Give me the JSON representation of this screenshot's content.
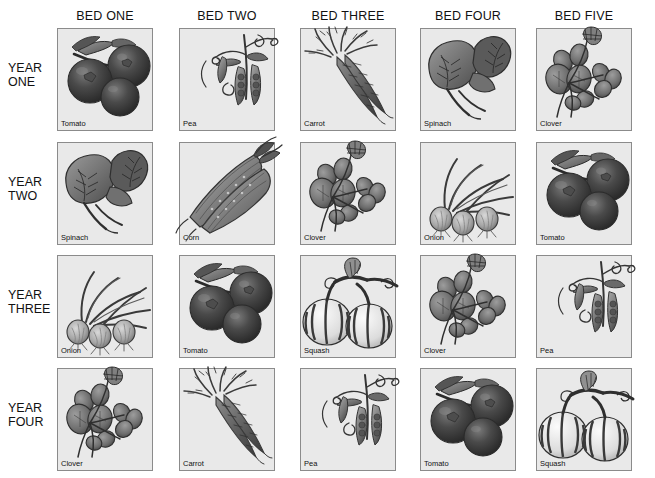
{
  "chart_data": {
    "type": "table",
    "xlabel": "",
    "ylabel": "",
    "columns": [
      "BED ONE",
      "BED TWO",
      "BED THREE",
      "BED FOUR",
      "BED FIVE"
    ],
    "rows": [
      "YEAR ONE",
      "YEAR TWO",
      "YEAR THREE",
      "YEAR FOUR"
    ],
    "cells": [
      [
        "Tomato",
        "Pea",
        "Carrot",
        "Spinach",
        "Clover"
      ],
      [
        "Spinach",
        "Corn",
        "Clover",
        "Onion",
        "Tomato"
      ],
      [
        "Onion",
        "Tomato",
        "Squash",
        "Clover",
        "Pea"
      ],
      [
        "Clover",
        "Carrot",
        "Pea",
        "Tomato",
        "Squash"
      ]
    ],
    "legend": [],
    "grid": false
  },
  "headers": [
    {
      "id": "bed-one",
      "label": "BED ONE"
    },
    {
      "id": "bed-two",
      "label": "BED TWO"
    },
    {
      "id": "bed-three",
      "label": "BED THREE"
    },
    {
      "id": "bed-four",
      "label": "BED FOUR"
    },
    {
      "id": "bed-five",
      "label": "BED FIVE"
    }
  ],
  "years": [
    {
      "id": "year-one",
      "line1": "YEAR",
      "line2": "ONE"
    },
    {
      "id": "year-two",
      "line1": "YEAR",
      "line2": "TWO"
    },
    {
      "id": "year-three",
      "line1": "YEAR",
      "line2": "THREE"
    },
    {
      "id": "year-four",
      "line1": "YEAR",
      "line2": "FOUR"
    }
  ],
  "panels": [
    {
      "row": 0,
      "col": 0,
      "crop": "Tomato",
      "art": "tomato"
    },
    {
      "row": 0,
      "col": 1,
      "crop": "Pea",
      "art": "pea"
    },
    {
      "row": 0,
      "col": 2,
      "crop": "Carrot",
      "art": "carrot"
    },
    {
      "row": 0,
      "col": 3,
      "crop": "Spinach",
      "art": "spinach"
    },
    {
      "row": 0,
      "col": 4,
      "crop": "Clover",
      "art": "clover"
    },
    {
      "row": 1,
      "col": 0,
      "crop": "Spinach",
      "art": "spinach"
    },
    {
      "row": 1,
      "col": 1,
      "crop": "Corn",
      "art": "corn"
    },
    {
      "row": 1,
      "col": 2,
      "crop": "Clover",
      "art": "clover"
    },
    {
      "row": 1,
      "col": 3,
      "crop": "Onion",
      "art": "onion"
    },
    {
      "row": 1,
      "col": 4,
      "crop": "Tomato",
      "art": "tomato"
    },
    {
      "row": 2,
      "col": 0,
      "crop": "Onion",
      "art": "onion"
    },
    {
      "row": 2,
      "col": 1,
      "crop": "Tomato",
      "art": "tomato"
    },
    {
      "row": 2,
      "col": 2,
      "crop": "Squash",
      "art": "squash"
    },
    {
      "row": 2,
      "col": 3,
      "crop": "Clover",
      "art": "clover"
    },
    {
      "row": 2,
      "col": 4,
      "crop": "Pea",
      "art": "pea"
    },
    {
      "row": 3,
      "col": 0,
      "crop": "Clover",
      "art": "clover"
    },
    {
      "row": 3,
      "col": 1,
      "crop": "Carrot",
      "art": "carrot"
    },
    {
      "row": 3,
      "col": 2,
      "crop": "Pea",
      "art": "pea"
    },
    {
      "row": 3,
      "col": 3,
      "crop": "Tomato",
      "art": "tomato"
    },
    {
      "row": 3,
      "col": 4,
      "crop": "Squash",
      "art": "squash"
    }
  ],
  "layout": {
    "col_x": [
      57,
      179,
      300,
      420,
      536
    ],
    "row_y": [
      28,
      142,
      255,
      368
    ],
    "panel_w": 96,
    "panel_h": 103
  },
  "colors": {
    "page_background": "#ffffff",
    "panel_fill": "#e9e9e9",
    "panel_border": "#8b8b8b",
    "text": "#111111",
    "ink_dark": "#3a3a3a",
    "ink_mid": "#6e6e6e",
    "ink_light": "#a8a8a8"
  }
}
